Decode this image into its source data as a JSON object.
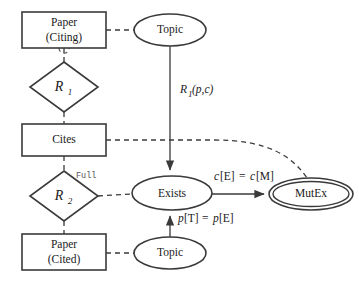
{
  "diagram": {
    "background_color": "#ffffff",
    "stroke_color": "#3a3a3a",
    "text_color": "#1a1a1a"
  },
  "entities": {
    "paper_citing": {
      "shape": "rectangle",
      "line1": "Paper",
      "line2": "(Citing)",
      "x": 22,
      "y": 12,
      "w": 84,
      "h": 36
    },
    "cites": {
      "shape": "rectangle",
      "line1": "Cites",
      "line2": "",
      "x": 22,
      "y": 124,
      "w": 84,
      "h": 32
    },
    "paper_cited": {
      "shape": "rectangle",
      "line1": "Paper",
      "line2": "(Cited)",
      "x": 22,
      "y": 234,
      "w": 84,
      "h": 36
    },
    "topic_top": {
      "shape": "ellipse",
      "label": "Topic",
      "cx": 170,
      "cy": 30,
      "rx": 36,
      "ry": 16
    },
    "topic_bottom": {
      "shape": "ellipse",
      "label": "Topic",
      "cx": 170,
      "cy": 253,
      "rx": 36,
      "ry": 16
    },
    "exists": {
      "shape": "ellipse",
      "label": "Exists",
      "cx": 172,
      "cy": 193,
      "rx": 40,
      "ry": 17
    },
    "mutex": {
      "shape": "double-ellipse",
      "label": "MutEx",
      "cx": 311,
      "cy": 194,
      "rx": 42,
      "ry": 16
    }
  },
  "relationships": {
    "r1": {
      "shape": "diamond",
      "label": "R",
      "subscript": "1",
      "cx": 64,
      "cy": 87,
      "rx": 34,
      "ry": 25
    },
    "r2": {
      "shape": "diamond",
      "label": "R",
      "subscript": "2",
      "cx": 64,
      "cy": 196,
      "rx": 34,
      "ry": 25
    }
  },
  "edge_labels": {
    "r1_pc": {
      "text": "R",
      "subscript": "1",
      "args": "(p,c)",
      "full": "R1(p,c)",
      "x": 193,
      "y": 90
    },
    "full_annotation": {
      "text": "Full",
      "x": 83,
      "y": 176
    },
    "c_equality": {
      "lhs": "c",
      "lhs_bracket": "[E]",
      "eq": " = ",
      "rhs": "c",
      "rhs_bracket": "[M]",
      "full": "c[E] = c[M]",
      "x": 245,
      "y": 177
    },
    "p_equality": {
      "lhs": "p",
      "lhs_bracket": "[T]",
      "eq": " = ",
      "rhs": "p",
      "rhs_bracket": "[E]",
      "full": "p[T] = p[E]",
      "x": 205,
      "y": 219
    },
    "citing_loop": {
      "text": "",
      "x": 64,
      "y": 53
    }
  },
  "edges": [
    {
      "name": "paper-citing-to-topic-top",
      "style": "dashed",
      "arrow": false
    },
    {
      "name": "paper-citing-to-r1",
      "style": "dashed",
      "arrow": false
    },
    {
      "name": "r1-to-cites",
      "style": "dashed",
      "arrow": false
    },
    {
      "name": "cites-to-r2",
      "style": "dashed",
      "arrow": false
    },
    {
      "name": "r2-to-paper-cited",
      "style": "dashed",
      "arrow": false
    },
    {
      "name": "paper-cited-to-topic-bottom",
      "style": "dashed",
      "arrow": false
    },
    {
      "name": "r2-to-exists",
      "style": "dashed",
      "arrow": false
    },
    {
      "name": "cites-to-mutex-curve",
      "style": "dashed",
      "arrow": false
    },
    {
      "name": "topic-top-to-exists",
      "style": "solid",
      "arrow": true
    },
    {
      "name": "exists-to-mutex",
      "style": "solid",
      "arrow": true
    },
    {
      "name": "topic-bottom-to-exists",
      "style": "solid",
      "arrow": true
    }
  ]
}
